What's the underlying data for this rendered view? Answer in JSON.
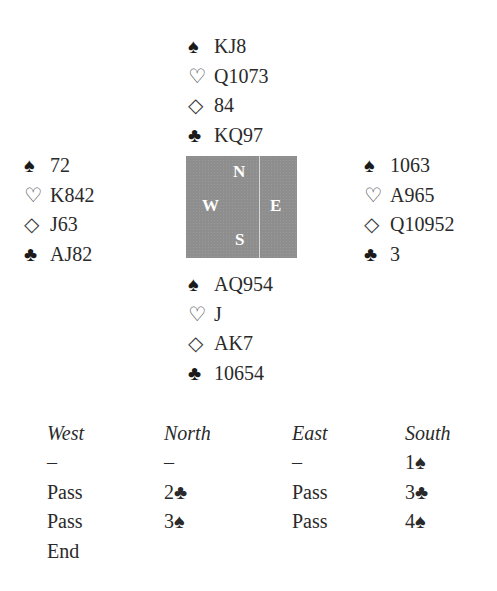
{
  "icons": {
    "spade": "♠",
    "heart": "♡",
    "diamond": "◇",
    "club": "♣"
  },
  "hands": {
    "north": {
      "spades": "KJ8",
      "hearts": "Q1073",
      "diamonds": "84",
      "clubs": "KQ97"
    },
    "west": {
      "spades": "72",
      "hearts": "K842",
      "diamonds": "J63",
      "clubs": "AJ82"
    },
    "east": {
      "spades": "1063",
      "hearts": "A965",
      "diamonds": "Q10952",
      "clubs": "3"
    },
    "south": {
      "spades": "AQ954",
      "hearts": "J",
      "diamonds": "AK7",
      "clubs": "10654"
    }
  },
  "compass": {
    "n": "N",
    "w": "W",
    "e": "E",
    "s": "S",
    "box_color": "#8e8e8e"
  },
  "auction": {
    "headers": [
      "West",
      "North",
      "East",
      "South"
    ],
    "rows": [
      [
        "–",
        "–",
        "–",
        "1♠"
      ],
      [
        "Pass",
        "2♣",
        "Pass",
        "3♣"
      ],
      [
        "Pass",
        "3♠",
        "Pass",
        "4♠"
      ],
      [
        "End",
        "",
        "",
        ""
      ]
    ]
  }
}
